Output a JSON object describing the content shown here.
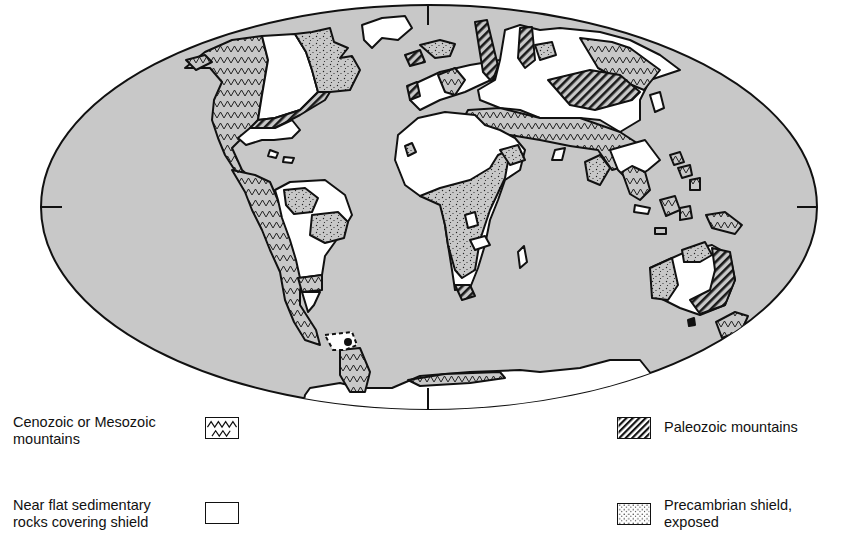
{
  "figure": {
    "type": "world-map",
    "projection": "elliptical (Mollweide-like) world projection",
    "ocean_color": "#c8c8c8",
    "land_outline_color": "#111111",
    "flat_rock_color": "#ffffff"
  },
  "legend": {
    "items": [
      {
        "key": "cenozoic",
        "label": "Cenozoic or Mesozoic\nmountains",
        "pattern": "zigzag"
      },
      {
        "key": "flat",
        "label": "Near flat sedimentary\nrocks covering shield",
        "pattern": "blank"
      },
      {
        "key": "paleozoic",
        "label": "Paleozoic mountains",
        "pattern": "diagonal-hatch"
      },
      {
        "key": "precambrian",
        "label": "Precambrian shield,\nexposed",
        "pattern": "stipple"
      }
    ]
  }
}
